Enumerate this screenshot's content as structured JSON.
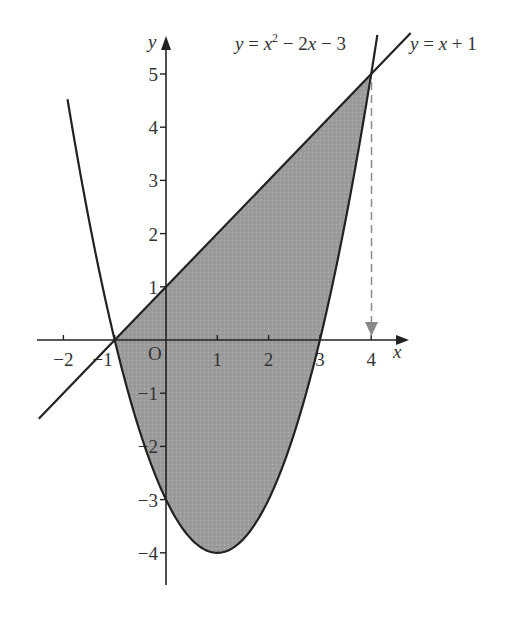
{
  "chart_data": {
    "type": "line",
    "title": "",
    "xlabel": "x",
    "ylabel": "y",
    "origin_label": "O",
    "xlim": [
      -2.5,
      4.8
    ],
    "ylim": [
      -4.6,
      5.7
    ],
    "grid": false,
    "x_ticks": [
      -2,
      -1,
      1,
      2,
      3,
      4
    ],
    "x_tick_labels": [
      "−2",
      "−1",
      "1",
      "2",
      "3",
      "4"
    ],
    "y_ticks": [
      5,
      4,
      3,
      2,
      1,
      -1,
      -2,
      -3,
      -4
    ],
    "y_tick_labels": [
      "5",
      "4",
      "3",
      "2",
      "1",
      "−1",
      "−2",
      "−3",
      "−4"
    ],
    "series": [
      {
        "name": "y = x^2 - 2x - 3",
        "label_parts": [
          "y",
          " = ",
          "x",
          "2",
          " − 2",
          "x",
          " − 3"
        ],
        "kind": "parabola",
        "coefficients": {
          "a": 1,
          "b": -2,
          "c": -3
        },
        "x_range": [
          -1.92,
          4.12
        ],
        "key_points": [
          [
            -1,
            0
          ],
          [
            0,
            -3
          ],
          [
            1,
            -4
          ],
          [
            3,
            0
          ],
          [
            4,
            5
          ]
        ],
        "color": "#222222"
      },
      {
        "name": "y = x + 1",
        "label_parts": [
          "y",
          " = ",
          "x",
          " + 1"
        ],
        "kind": "line",
        "slope": 1,
        "intercept": 1,
        "x_range": [
          -2.48,
          4.77
        ],
        "key_points": [
          [
            -1,
            0
          ],
          [
            0,
            1
          ],
          [
            4,
            5
          ]
        ],
        "color": "#222222"
      }
    ],
    "shaded_region": {
      "description": "Region between y = x + 1 (above) and y = x^2 - 2x - 3 (below) for -1 <= x <= 4",
      "x_from": -1,
      "x_to": 4,
      "fill": "#9a9a9a"
    },
    "intersections": [
      [
        -1,
        0
      ],
      [
        4,
        5
      ]
    ],
    "annotations": [
      {
        "type": "dashed-arrow",
        "from": [
          4,
          5
        ],
        "to": [
          4,
          0
        ],
        "color": "#888888"
      }
    ]
  }
}
